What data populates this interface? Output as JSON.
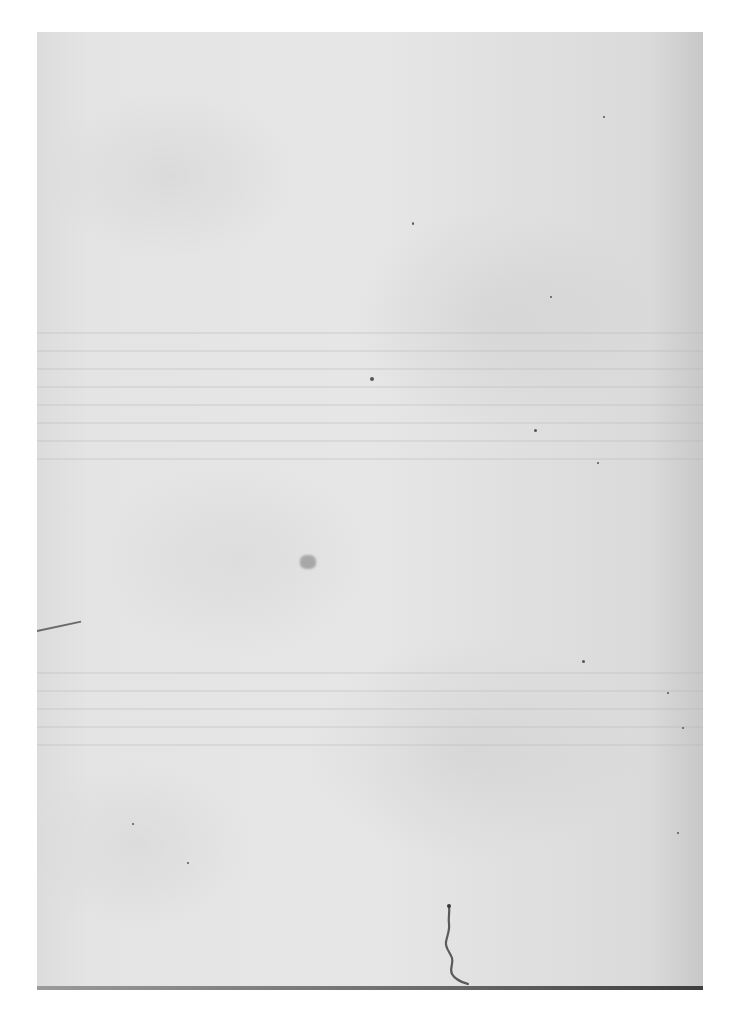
{
  "document": {
    "type": "scanned blank page",
    "description": "Blank aged paper page with faint bleed-through, specks, and a small ink mark near the bottom",
    "visible_text": ""
  },
  "colors": {
    "background": "#ffffff",
    "paper": "#e4e4e4",
    "paper_edge_shadow": "#c8c8c8",
    "bottom_edge": "#3e3e3e",
    "ink": "#555555"
  }
}
